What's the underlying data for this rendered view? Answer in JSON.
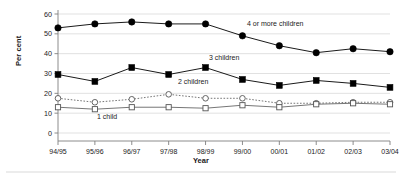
{
  "chart_data": {
    "type": "line",
    "title": "",
    "xlabel": "Year",
    "ylabel": "Per cent",
    "categories": [
      "94/95",
      "95/96",
      "96/97",
      "97/98",
      "98/99",
      "99/00",
      "00/01",
      "01/02",
      "02/03",
      "03/04"
    ],
    "ylim": [
      0,
      60
    ],
    "yticks": [
      0,
      10,
      20,
      30,
      40,
      50,
      60
    ],
    "grid": true,
    "legend_position": "inline-annotations",
    "series": [
      {
        "name": "4 or more children",
        "marker": "filled-circle",
        "linestyle": "solid",
        "color": "#000000",
        "values": [
          53,
          55,
          56,
          55,
          55,
          49,
          44,
          40.5,
          42.5,
          41
        ]
      },
      {
        "name": "3 children",
        "marker": "filled-square",
        "linestyle": "solid",
        "color": "#000000",
        "values": [
          29.5,
          26,
          33,
          29.5,
          33,
          27,
          24,
          26.5,
          25,
          23
        ]
      },
      {
        "name": "2 children",
        "marker": "open-circle",
        "linestyle": "dotted",
        "color": "#666666",
        "values": [
          17.5,
          15.5,
          17,
          19.5,
          17.5,
          17.5,
          15,
          15,
          15.5,
          15.5
        ]
      },
      {
        "name": "1 child",
        "marker": "open-square",
        "linestyle": "solid",
        "color": "#666666",
        "values": [
          13,
          12,
          13,
          13,
          12.5,
          14,
          13,
          14.5,
          15,
          14.5
        ]
      }
    ],
    "annotations": [
      {
        "text": "4 or more children",
        "series": "4 or more children",
        "x_px": 247,
        "y_px": 26
      },
      {
        "text": "3 children",
        "series": "3 children",
        "x_px": 209,
        "y_px": 60
      },
      {
        "text": "2 children",
        "series": "2 children",
        "x_px": 178,
        "y_px": 84
      },
      {
        "text": "1 child",
        "series": "1 child",
        "x_px": 97,
        "y_px": 119
      }
    ]
  }
}
